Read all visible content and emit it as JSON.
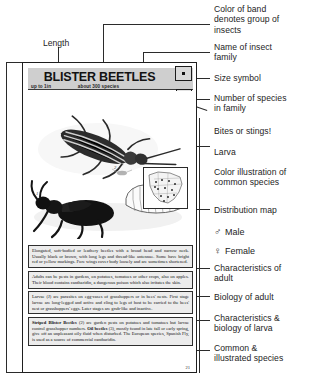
{
  "annotations": {
    "length": "Length",
    "color_band": "Color of band\ndenotes group of\ninsects",
    "family_name": "Name of insect\nfamily",
    "size_symbol": "Size symbol",
    "species_count": "Number of species\nin family",
    "bites_stings": "Bites or stings!",
    "larva": "Larva",
    "color_illustration": "Color illustration of\ncommon species",
    "distribution_map": "Distribution map",
    "male": "Male",
    "female": "Female",
    "male_symbol": "♂",
    "female_symbol": "♀",
    "characteristics_adult": "Characteristics of\nadult",
    "biology_adult": "Biology of adult",
    "characteristics_larva": "Characteristics &\nbiology of larva",
    "common_species": "Common &\nillustrated species"
  },
  "guide_page": {
    "title": "BLISTER BEETLES",
    "length_label": "up to 1in",
    "species_label": "about 300 species",
    "page_number": "21",
    "marks": {
      "adult": "1",
      "larva": "2",
      "oil_beetle": "3"
    },
    "text_blocks": [
      {
        "id": "characteristics-adult",
        "lead": "",
        "text": "Elongated, soft-bodied or leathery beetles with a broad head and narrow neck. Usually black or brown, with long legs and thread-like antennae. Some have bright red or yellow markings. Fore wings cover body loosely and are sometimes shortened."
      },
      {
        "id": "biology-adult",
        "lead": "",
        "text": "Adults can be pests in gardens, on potatoes, tomatoes or other crops, also on apples. Their blood contains cantharidin, a dangerous poison which also irritates the skin."
      },
      {
        "id": "characteristics-larva",
        "lead": "",
        "text": "Larvae (J) are parasites on egg-cases of grasshoppers or in bees' nests. First stage larvae are long-legged and active and cling to legs of host to be carried to the bees' nest or grasshoppers' eggs. Later stages are grub-like and inactive."
      },
      {
        "id": "common-species",
        "lead": "Striped Blister Beetles",
        "text": " (2) are garden pests on potatoes and tomatoes but larvae control grasshopper numbers. ",
        "lead2": "Oil beetles",
        "text2": " (3), mostly found in late fall or early spring, give off an unpleasant oily fluid when disturbed. The European species, Spanish Fly, is used as a source of commercial cantharidin."
      }
    ]
  },
  "colors": {
    "band": "#cfcfcf",
    "text_block_bg": "#ececec",
    "ink": "#1a1a1a",
    "leader": "#2b2b2b"
  }
}
